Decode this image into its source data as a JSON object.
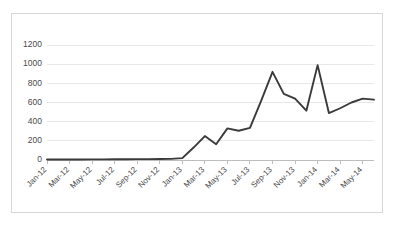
{
  "chart_data": {
    "type": "line",
    "title": "",
    "subtitle": "",
    "xlabel": "",
    "ylabel": "",
    "ylim": [
      0,
      1200
    ],
    "ytick_labels": [
      "0",
      "200",
      "400",
      "600",
      "800",
      "1000",
      "1200"
    ],
    "ytick_values": [
      0,
      200,
      400,
      600,
      800,
      1000,
      1200
    ],
    "grid": true,
    "legend": false,
    "legend_position": "none",
    "x_tick_label_rotation": 45,
    "x_label_interval_months": 2,
    "categories": [
      "Jan-12",
      "Feb-12",
      "Mar-12",
      "Apr-12",
      "May-12",
      "Jun-12",
      "Jul-12",
      "Aug-12",
      "Sep-12",
      "Oct-12",
      "Nov-12",
      "Dec-12",
      "Jan-13",
      "Feb-13",
      "Mar-13",
      "Apr-13",
      "May-13",
      "Jun-13",
      "Jul-13",
      "Aug-13",
      "Sep-13",
      "Oct-13",
      "Nov-13",
      "Dec-13",
      "Jan-14",
      "Feb-14",
      "Mar-14",
      "Apr-14",
      "May-14",
      "Jun-14"
    ],
    "xtick_labels": [
      "Jan-12",
      "Mar-12",
      "May-12",
      "Jul-12",
      "Sep-12",
      "Nov-12",
      "Jan-13",
      "Mar-13",
      "May-13",
      "Jul-13",
      "Sep-13",
      "Nov-13",
      "Jan-14",
      "Mar-14",
      "May-14"
    ],
    "values": [
      5,
      5,
      6,
      6,
      7,
      7,
      8,
      8,
      9,
      9,
      10,
      12,
      20,
      130,
      250,
      165,
      330,
      305,
      335,
      620,
      920,
      690,
      640,
      515,
      990,
      490,
      540,
      600,
      640,
      630
    ],
    "series": [
      {
        "name": "Series 1",
        "color": "#3a3a3a",
        "values": [
          5,
          5,
          6,
          6,
          7,
          7,
          8,
          8,
          9,
          9,
          10,
          12,
          20,
          130,
          250,
          165,
          330,
          305,
          335,
          620,
          920,
          690,
          640,
          515,
          990,
          490,
          540,
          600,
          640,
          630
        ]
      }
    ]
  }
}
